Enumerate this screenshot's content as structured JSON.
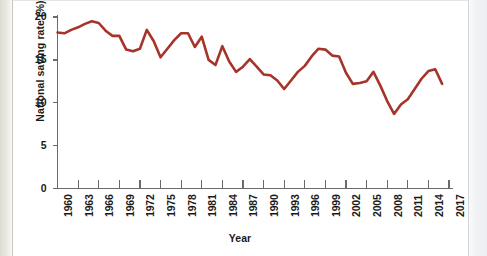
{
  "figure": {
    "background_color": "#ffffff",
    "line_color": "#A6342A",
    "axis_color": "#6b6b6b",
    "text_color": "#1a1a1a"
  },
  "chart_data": {
    "type": "line",
    "title": "",
    "xlabel": "Year",
    "ylabel": "National saving rate (%)",
    "xlim": [
      1960,
      2017
    ],
    "ylim": [
      0,
      20
    ],
    "yticks": [
      0,
      5,
      10,
      15,
      20
    ],
    "ytick_labels": [
      "0",
      "5",
      "10",
      "15",
      "20"
    ],
    "xticks": [
      1960,
      1963,
      1966,
      1969,
      1972,
      1975,
      1978,
      1981,
      1984,
      1987,
      1990,
      1993,
      1996,
      1999,
      2002,
      2005,
      2008,
      2011,
      2014,
      2017
    ],
    "xtick_labels": [
      "1960",
      "1963",
      "1966",
      "1969",
      "1972",
      "1975",
      "1978",
      "1981",
      "1984",
      "1987",
      "1990",
      "1993",
      "1996",
      "1999",
      "2002",
      "2005",
      "2008",
      "2011",
      "2014",
      "2017"
    ],
    "grid": false,
    "legend": null,
    "series": [
      {
        "name": "National saving rate",
        "color": "#A6342A",
        "x": [
          1960,
          1961,
          1962,
          1963,
          1964,
          1965,
          1966,
          1967,
          1968,
          1969,
          1970,
          1971,
          1972,
          1973,
          1974,
          1975,
          1976,
          1977,
          1978,
          1979,
          1980,
          1981,
          1982,
          1983,
          1984,
          1985,
          1986,
          1987,
          1988,
          1989,
          1990,
          1991,
          1992,
          1993,
          1994,
          1995,
          1996,
          1997,
          1998,
          1999,
          2000,
          2001,
          2002,
          2003,
          2004,
          2005,
          2006,
          2007,
          2008,
          2009,
          2010,
          2011,
          2012,
          2013,
          2014,
          2015,
          2016
        ],
        "values": [
          18.2,
          18.1,
          18.5,
          18.8,
          19.2,
          19.5,
          19.3,
          18.4,
          17.8,
          17.8,
          16.2,
          16.0,
          16.3,
          18.5,
          17.2,
          15.3,
          16.3,
          17.3,
          18.1,
          18.1,
          16.5,
          17.7,
          15.0,
          14.4,
          16.6,
          14.8,
          13.6,
          14.2,
          15.1,
          14.2,
          13.3,
          13.2,
          12.6,
          11.6,
          12.6,
          13.6,
          14.3,
          15.4,
          16.3,
          16.2,
          15.5,
          15.4,
          13.5,
          12.2,
          12.3,
          12.5,
          13.6,
          12.0,
          10.2,
          8.7,
          9.8,
          10.4,
          11.6,
          12.8,
          13.7,
          13.9,
          12.2
        ]
      }
    ]
  }
}
